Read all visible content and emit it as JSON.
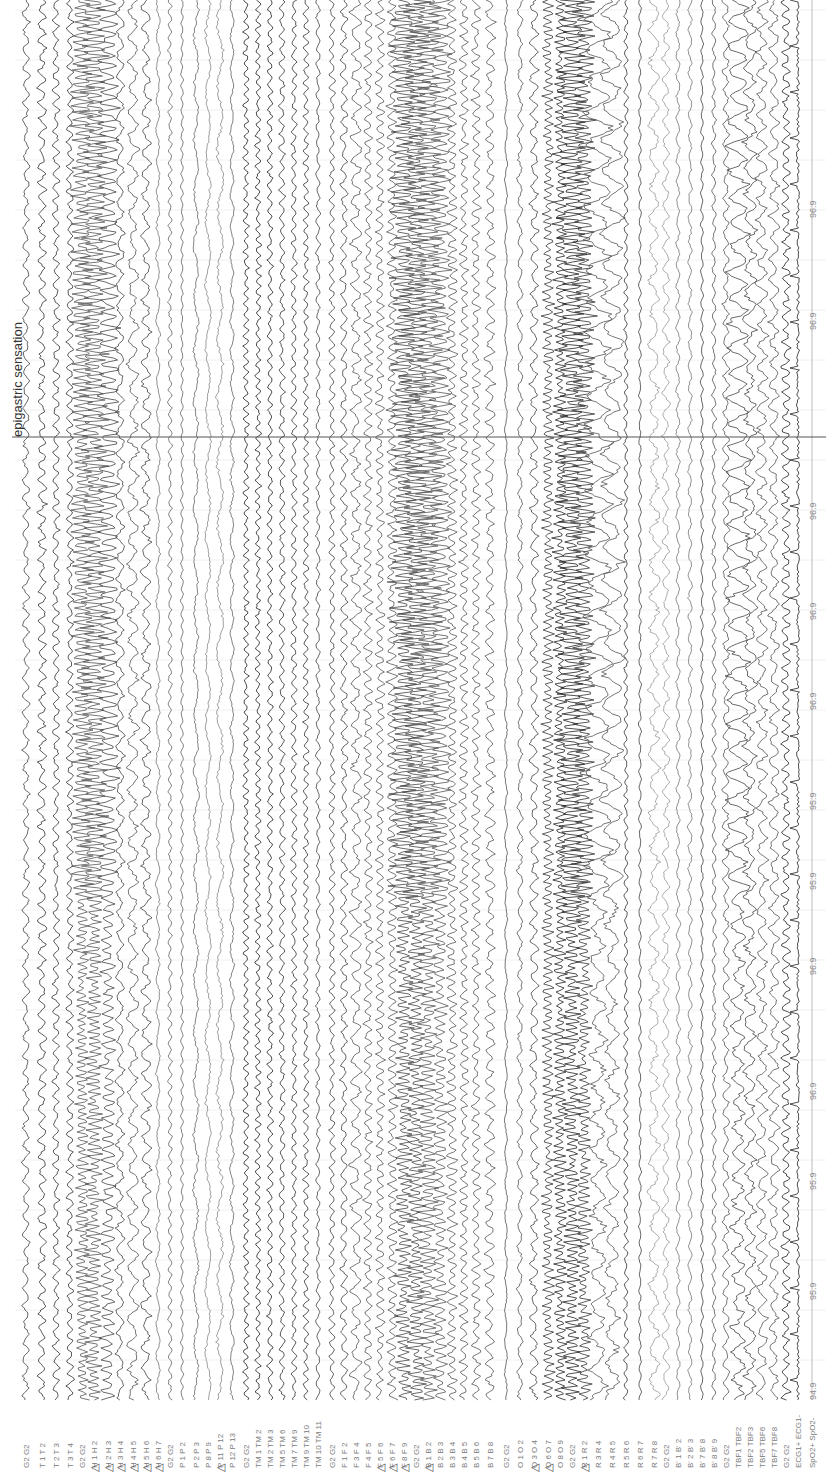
{
  "recording": {
    "orientation": "rotated-90",
    "event_marker": {
      "label": "epigastric sensation",
      "y": 437
    },
    "spo2_channel_values": [
      {
        "value": "96.9",
        "y": 218
      },
      {
        "value": "96.9",
        "y": 330
      },
      {
        "value": "96.9",
        "y": 520
      },
      {
        "value": "96.9",
        "y": 620
      },
      {
        "value": "96.9",
        "y": 710
      },
      {
        "value": "95.9",
        "y": 810
      },
      {
        "value": "95.9",
        "y": 890
      },
      {
        "value": "96.9",
        "y": 975
      },
      {
        "value": "96.9",
        "y": 1100
      },
      {
        "value": "95.9",
        "y": 1190
      },
      {
        "value": "95.9",
        "y": 1300
      },
      {
        "value": "94.9",
        "y": 1400
      }
    ],
    "channels": [
      {
        "label": "G2 G2",
        "x": 26,
        "flag": false,
        "amp": 5,
        "freq": 0.35,
        "shade": "#444"
      },
      {
        "label": "T 1 T 2",
        "x": 42,
        "flag": false,
        "amp": 6,
        "freq": 0.4,
        "shade": "#333"
      },
      {
        "label": "T 2 T 3",
        "x": 56,
        "flag": false,
        "amp": 5,
        "freq": 0.45,
        "shade": "#333"
      },
      {
        "label": "T 3 T 4",
        "x": 70,
        "flag": false,
        "amp": 5,
        "freq": 0.5,
        "shade": "#333"
      },
      {
        "label": "G2 G2",
        "x": 82,
        "flag": false,
        "amp": 10,
        "freq": 0.9,
        "shade": "#555"
      },
      {
        "label": "H 1 H 2",
        "x": 94,
        "flag": true,
        "amp": 12,
        "freq": 0.95,
        "shade": "#555"
      },
      {
        "label": "H 2 H 3",
        "x": 108,
        "flag": true,
        "amp": 10,
        "freq": 0.6,
        "shade": "#444"
      },
      {
        "label": "H 3 H 4",
        "x": 120,
        "flag": true,
        "amp": 6,
        "freq": 0.3,
        "shade": "#444"
      },
      {
        "label": "H 4 H 5",
        "x": 133,
        "flag": true,
        "amp": 8,
        "freq": 0.25,
        "shade": "#555"
      },
      {
        "label": "H 5 H 6",
        "x": 146,
        "flag": true,
        "amp": 7,
        "freq": 0.3,
        "shade": "#444"
      },
      {
        "label": "H 6 H 7",
        "x": 158,
        "flag": true,
        "amp": 3,
        "freq": 0.2,
        "shade": "#777"
      },
      {
        "label": "G2 G2",
        "x": 170,
        "flag": false,
        "amp": 3,
        "freq": 0.5,
        "shade": "#666"
      },
      {
        "label": "P 1 P 2",
        "x": 182,
        "flag": false,
        "amp": 2,
        "freq": 0.5,
        "shade": "#666"
      },
      {
        "label": "P 2 P 3",
        "x": 196,
        "flag": false,
        "amp": 4,
        "freq": 0.12,
        "shade": "#666"
      },
      {
        "label": "P 8 P 9",
        "x": 208,
        "flag": false,
        "amp": 4,
        "freq": 0.1,
        "shade": "#888"
      },
      {
        "label": "P 11 P 12",
        "x": 220,
        "flag": true,
        "amp": 5,
        "freq": 0.1,
        "shade": "#888"
      },
      {
        "label": "P 12 P 13",
        "x": 232,
        "flag": false,
        "amp": 3,
        "freq": 0.2,
        "shade": "#666"
      },
      {
        "label": "G2 G2",
        "x": 246,
        "flag": false,
        "amp": 4,
        "freq": 0.6,
        "shade": "#222"
      },
      {
        "label": "TM 1 TM 2",
        "x": 258,
        "flag": false,
        "amp": 4,
        "freq": 0.6,
        "shade": "#222"
      },
      {
        "label": "TM 2 TM 3",
        "x": 270,
        "flag": false,
        "amp": 4,
        "freq": 0.5,
        "shade": "#222"
      },
      {
        "label": "TM 5 TM 6",
        "x": 282,
        "flag": false,
        "amp": 4,
        "freq": 0.45,
        "shade": "#333"
      },
      {
        "label": "TM 7 TM 9",
        "x": 294,
        "flag": false,
        "amp": 4,
        "freq": 0.5,
        "shade": "#333"
      },
      {
        "label": "TM 9 TM 10",
        "x": 306,
        "flag": false,
        "amp": 4,
        "freq": 0.55,
        "shade": "#333"
      },
      {
        "label": "TM 10 TM 11",
        "x": 318,
        "flag": false,
        "amp": 3,
        "freq": 0.4,
        "shade": "#444"
      },
      {
        "label": "G2 G2",
        "x": 332,
        "flag": false,
        "amp": 4,
        "freq": 0.5,
        "shade": "#444"
      },
      {
        "label": "F 1 F 2",
        "x": 344,
        "flag": false,
        "amp": 5,
        "freq": 0.4,
        "shade": "#444"
      },
      {
        "label": "F 3 F 4",
        "x": 356,
        "flag": false,
        "amp": 8,
        "freq": 0.3,
        "shade": "#555"
      },
      {
        "label": "F 4 F 5",
        "x": 368,
        "flag": false,
        "amp": 6,
        "freq": 0.5,
        "shade": "#555"
      },
      {
        "label": "F 5 F 6",
        "x": 380,
        "flag": true,
        "amp": 6,
        "freq": 0.55,
        "shade": "#555"
      },
      {
        "label": "F 6 F 7",
        "x": 392,
        "flag": true,
        "amp": 7,
        "freq": 0.6,
        "shade": "#555"
      },
      {
        "label": "F 8 F 9",
        "x": 404,
        "flag": true,
        "amp": 12,
        "freq": 0.95,
        "shade": "#444"
      },
      {
        "label": "G2 G2",
        "x": 416,
        "flag": false,
        "amp": 13,
        "freq": 0.95,
        "shade": "#444"
      },
      {
        "label": "B 1 B 2",
        "x": 428,
        "flag": true,
        "amp": 13,
        "freq": 0.9,
        "shade": "#555"
      },
      {
        "label": "B 2 B 3",
        "x": 440,
        "flag": false,
        "amp": 10,
        "freq": 0.7,
        "shade": "#555"
      },
      {
        "label": "B 3 B 4",
        "x": 452,
        "flag": false,
        "amp": 7,
        "freq": 0.6,
        "shade": "#555"
      },
      {
        "label": "B 4 B 5",
        "x": 464,
        "flag": false,
        "amp": 6,
        "freq": 0.55,
        "shade": "#555"
      },
      {
        "label": "B 5 B 6",
        "x": 476,
        "flag": false,
        "amp": 6,
        "freq": 0.5,
        "shade": "#555"
      },
      {
        "label": "B 7 B 8",
        "x": 490,
        "flag": false,
        "amp": 7,
        "freq": 0.4,
        "shade": "#555"
      },
      {
        "label": "G2 G2",
        "x": 506,
        "flag": false,
        "amp": 2,
        "freq": 0.2,
        "shade": "#555"
      },
      {
        "label": "O 1 O 2",
        "x": 520,
        "flag": false,
        "amp": 4,
        "freq": 0.3,
        "shade": "#555"
      },
      {
        "label": "O 3 O 4",
        "x": 534,
        "flag": true,
        "amp": 6,
        "freq": 0.35,
        "shade": "#444"
      },
      {
        "label": "O 6 O 7",
        "x": 548,
        "flag": true,
        "amp": 8,
        "freq": 0.8,
        "shade": "#333"
      },
      {
        "label": "O 8 O 9",
        "x": 560,
        "flag": false,
        "amp": 9,
        "freq": 0.9,
        "shade": "#222"
      },
      {
        "label": "G2 G2",
        "x": 572,
        "flag": false,
        "amp": 12,
        "freq": 0.95,
        "shade": "#222"
      },
      {
        "label": "R 1 R 2",
        "x": 584,
        "flag": true,
        "amp": 10,
        "freq": 0.9,
        "shade": "#333"
      },
      {
        "label": "R 3 R 4",
        "x": 598,
        "flag": false,
        "amp": 12,
        "freq": 0.2,
        "shade": "#555"
      },
      {
        "label": "R 4 R 5",
        "x": 612,
        "flag": false,
        "amp": 10,
        "freq": 0.2,
        "shade": "#555"
      },
      {
        "label": "R 5 R 6",
        "x": 626,
        "flag": false,
        "amp": 3,
        "freq": 0.5,
        "shade": "#333"
      },
      {
        "label": "R 6 R 7",
        "x": 640,
        "flag": false,
        "amp": 2,
        "freq": 0.4,
        "shade": "#444"
      },
      {
        "label": "R 7 R 8",
        "x": 654,
        "flag": false,
        "amp": 8,
        "freq": 0.2,
        "shade": "#999"
      },
      {
        "label": "G2 G2",
        "x": 666,
        "flag": false,
        "amp": 5,
        "freq": 0.3,
        "shade": "#999"
      },
      {
        "label": "B' 1 B' 2",
        "x": 678,
        "flag": false,
        "amp": 3,
        "freq": 0.3,
        "shade": "#777"
      },
      {
        "label": "B' 2 B' 3",
        "x": 690,
        "flag": false,
        "amp": 3,
        "freq": 0.3,
        "shade": "#777"
      },
      {
        "label": "B' 7 B' 8",
        "x": 702,
        "flag": false,
        "amp": 2,
        "freq": 0.4,
        "shade": "#444"
      },
      {
        "label": "B' 8 B' 9",
        "x": 714,
        "flag": false,
        "amp": 3,
        "freq": 0.4,
        "shade": "#555"
      },
      {
        "label": "G2 G2",
        "x": 726,
        "flag": false,
        "amp": 5,
        "freq": 0.35,
        "shade": "#555"
      },
      {
        "label": "TBF1 TBF2",
        "x": 738,
        "flag": false,
        "amp": 10,
        "freq": 0.25,
        "shade": "#444"
      },
      {
        "label": "TBF2 TBF3",
        "x": 750,
        "flag": false,
        "amp": 9,
        "freq": 0.25,
        "shade": "#444"
      },
      {
        "label": "TBF5 TBF6",
        "x": 762,
        "flag": false,
        "amp": 8,
        "freq": 0.3,
        "shade": "#555"
      },
      {
        "label": "TBF7 TBF8",
        "x": 774,
        "flag": false,
        "amp": 7,
        "freq": 0.3,
        "shade": "#555"
      },
      {
        "label": "G2 G2",
        "x": 786,
        "flag": false,
        "amp": 6,
        "freq": 0.5,
        "shade": "#222"
      },
      {
        "label": "ECG1+ ECG1-",
        "x": 798,
        "flag": false,
        "amp": 6,
        "freq": 0.9,
        "shade": "#222",
        "type": "ecg"
      },
      {
        "label": "SpO2+ SpO2-",
        "x": 812,
        "flag": false,
        "amp": 0,
        "freq": 0,
        "shade": "#aaa",
        "type": "flat"
      }
    ]
  }
}
